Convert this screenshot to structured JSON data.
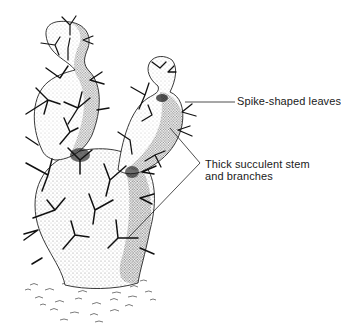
{
  "diagram": {
    "labels": {
      "spikes": "Spike-shaped leaves",
      "stem_line1": "Thick succulent stem",
      "stem_line2": "and branches"
    },
    "colors": {
      "ink": "#1a1a1a",
      "background": "#ffffff"
    }
  }
}
